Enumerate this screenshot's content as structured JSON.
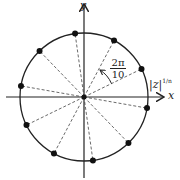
{
  "diagram": {
    "axes": {
      "x_label": "x",
      "y_label": "y"
    },
    "angle_label": {
      "numerator": "2π",
      "denominator": "10"
    },
    "radius_label": {
      "base": "|z|",
      "exponent": "1/n"
    },
    "points_count": 10,
    "start_angle_deg": 26,
    "step_deg": 36,
    "colors": {
      "stroke": "#222222",
      "point": "#111111"
    }
  }
}
